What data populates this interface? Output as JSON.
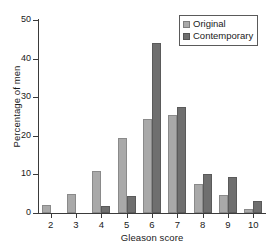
{
  "chart_data": {
    "type": "bar",
    "title": "",
    "xlabel": "Gleason score",
    "ylabel": "Percentage of men",
    "categories": [
      "2",
      "3",
      "4",
      "5",
      "6",
      "7",
      "8",
      "9",
      "10"
    ],
    "series": [
      {
        "name": "Original",
        "color": "#a9a9a9",
        "values": [
          2.2,
          5.0,
          11.0,
          19.5,
          24.3,
          25.3,
          7.6,
          4.6,
          1.0
        ]
      },
      {
        "name": "Contemporary",
        "color": "#6f6f6f",
        "values": [
          0.0,
          0.0,
          1.8,
          4.5,
          44.0,
          27.5,
          10.0,
          9.3,
          3.0
        ]
      }
    ],
    "ylim": [
      0,
      50
    ],
    "yticks": [
      0,
      10,
      20,
      30,
      40,
      50
    ],
    "ytick_labels": [
      "0",
      "10",
      "20",
      "30",
      "40",
      "50"
    ],
    "grid": false,
    "legend_position": "top-right",
    "legend_entries": [
      "Original",
      "Contemporary"
    ]
  },
  "axes": {
    "x_title": "Gleason score",
    "y_title": "Percentage of men"
  },
  "legend": {
    "items": [
      {
        "label": "Original"
      },
      {
        "label": "Contemporary"
      }
    ]
  }
}
